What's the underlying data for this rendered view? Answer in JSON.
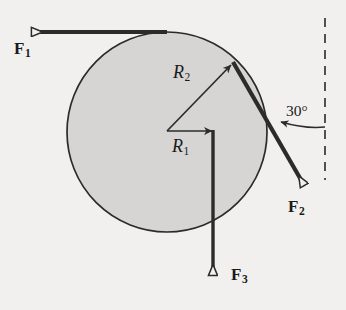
{
  "figure": {
    "type": "free-body-diagram",
    "width": 346,
    "height": 310,
    "background_color": "#f1f0ee",
    "ink_color": "#2b2b2b"
  },
  "disk": {
    "name": "shaded-circular-disk",
    "center_x": 167,
    "center_y": 132,
    "radius": 100,
    "fill_color": "#d6d5d3",
    "stroke_color": "#2b2b2b"
  },
  "radii": [
    {
      "id": "R1",
      "label": "R",
      "subscript": "1",
      "label_x": 172,
      "label_y": 138,
      "direction": "horizontal-right-from-center",
      "tip_x": 213,
      "tip_y": 130
    },
    {
      "id": "R2",
      "label": "R",
      "subscript": "2",
      "label_x": 173,
      "label_y": 64,
      "direction": "up-right-to-rim",
      "tip_x": 232,
      "tip_y": 64
    }
  ],
  "forces": [
    {
      "id": "F1",
      "label": "F",
      "subscript": "1",
      "label_x": 14,
      "label_y": 40,
      "description": "tangent at top of disk, pointing left",
      "tail_x": 167,
      "tail_y": 32,
      "head_x": 20,
      "head_y": 32,
      "arrowhead": "hollow-triangle"
    },
    {
      "id": "F2",
      "label": "F",
      "subscript": "2",
      "label_x": 290,
      "label_y": 205,
      "description": "tangent at upper right of disk, pointing down-right at 30 degrees from vertical",
      "tail_x": 233,
      "tail_y": 62,
      "head_x": 312,
      "head_y": 198,
      "arrowhead": "hollow-triangle"
    },
    {
      "id": "F3",
      "label": "F",
      "subscript": "3",
      "label_x": 230,
      "label_y": 272,
      "description": "vertical downward from tip of R1",
      "tail_x": 213,
      "tail_y": 130,
      "head_x": 213,
      "head_y": 288,
      "arrowhead": "hollow-triangle"
    }
  ],
  "angle": {
    "name": "angle-between-F2-and-vertical",
    "value": "30",
    "unit": "°",
    "text": "30°",
    "label_x": 287,
    "label_y": 104
  },
  "reference_line": {
    "name": "vertical-dashed-reference",
    "x": 325,
    "y_top": 18,
    "y_bottom": 180,
    "style": "dashed"
  }
}
